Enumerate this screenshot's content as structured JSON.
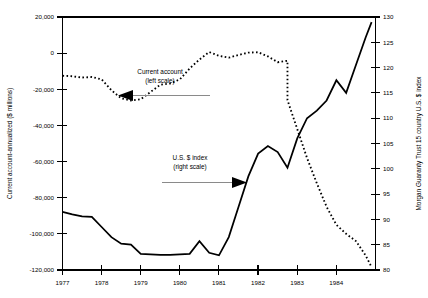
{
  "chart_data": {
    "type": "line",
    "title": "",
    "xlabel": "",
    "ylabel": "Current account-annualized ($ millions)",
    "y2label": "Morgan Guaranty Trust 15 country U.S. $ index",
    "grid": false,
    "legend_position": "inline-annotations",
    "xlim": [
      1977.0,
      1985.0
    ],
    "ylim": [
      -120000,
      20000
    ],
    "y2lim": [
      80,
      130
    ],
    "x_ticks": [
      "1977",
      "1978",
      "1979",
      "1980",
      "1981",
      "1982",
      "1983",
      "1984"
    ],
    "x_tick_values": [
      1977,
      1978,
      1979,
      1980,
      1981,
      1982,
      1983,
      1984
    ],
    "y_ticks": [
      "20,000",
      "0",
      "-20,000",
      "-40,000",
      "-60,000",
      "-80,000",
      "-100,000",
      "-120,000"
    ],
    "y_tick_values": [
      20000,
      0,
      -20000,
      -40000,
      -60000,
      -80000,
      -100000,
      -120000
    ],
    "y2_ticks": [
      "130",
      "125",
      "120",
      "115",
      "110",
      "105",
      "100",
      "95",
      "90",
      "85",
      "80"
    ],
    "y2_tick_values": [
      130,
      125,
      120,
      115,
      110,
      105,
      100,
      95,
      90,
      85,
      80
    ],
    "series": [
      {
        "name": "Current account",
        "axis": "left",
        "style": "dashed",
        "units": "$ millions, annualized",
        "x": [
          1977.0,
          1977.25,
          1977.5,
          1977.75,
          1978.0,
          1978.25,
          1978.5,
          1978.75,
          1979.0,
          1979.25,
          1979.5,
          1979.75,
          1980.0,
          1980.25,
          1980.5,
          1980.75,
          1981.0,
          1981.25,
          1981.5,
          1981.75,
          1982.0,
          1982.25,
          1982.5,
          1982.75,
          1983.0,
          1983.25,
          1983.5,
          1983.75,
          1984.0,
          1984.25,
          1984.5,
          1984.75
        ],
        "values": [
          -12500,
          -12800,
          -13500,
          -13200,
          -14500,
          -20500,
          -25000,
          -26200,
          -25500,
          -21500,
          -17500,
          -16800,
          -14500,
          -8500,
          -3500,
          600,
          -1500,
          -2500,
          -1000,
          300,
          500,
          -1800,
          -5000,
          -4200,
          5800,
          1500,
          -10500,
          -20000,
          -24500,
          -21000,
          -27500,
          -31500
        ]
      },
      {
        "name": "Current account (continued decline)",
        "axis": "left",
        "style": "dashed",
        "units": "$ millions, annualized",
        "x": [
          1982.75,
          1983.0,
          1983.25,
          1983.5,
          1983.75,
          1984.0,
          1984.25,
          1984.5,
          1984.75,
          1984.9
        ],
        "values": [
          -26000,
          -42000,
          -58000,
          -72000,
          -85000,
          -95000,
          -100000,
          -104000,
          -112000,
          -118500
        ]
      },
      {
        "name": "U.S. $ index",
        "axis": "right",
        "style": "solid",
        "units": "index",
        "x": [
          1977.0,
          1977.25,
          1977.5,
          1977.75,
          1978.0,
          1978.25,
          1978.5,
          1978.75,
          1979.0,
          1979.25,
          1979.5,
          1979.75,
          1980.0,
          1980.25,
          1980.5,
          1980.75,
          1981.0,
          1981.25,
          1981.5,
          1981.75,
          1982.0,
          1982.25,
          1982.5,
          1982.75,
          1983.0,
          1983.25,
          1983.5,
          1983.75,
          1984.0,
          1984.25,
          1984.5,
          1984.75,
          1984.9
        ],
        "values": [
          91.5,
          91.0,
          90.6,
          90.5,
          88.5,
          86.5,
          85.2,
          85.0,
          83.2,
          83.1,
          83.0,
          83.0,
          83.1,
          83.2,
          85.7,
          83.4,
          82.9,
          86.5,
          92.5,
          98.5,
          103.0,
          104.5,
          103.3,
          100.2,
          106.0,
          110.0,
          111.5,
          113.5,
          117.5,
          115.0,
          120.5,
          126.0,
          129.0
        ]
      }
    ],
    "annotations": [
      {
        "id": "current-account-annotation",
        "label_line1": "Current account",
        "label_line2": "(left scale)",
        "arrow_direction": "left"
      },
      {
        "id": "dollar-index-annotation",
        "label_line1": "U.S. $ index",
        "label_line2": "(right scale)",
        "arrow_direction": "right"
      }
    ]
  },
  "axes": {
    "left_title": "Current account-annualized ($ millions)",
    "right_title": "Morgan Guaranty Trust 15 country U.S. $ index"
  }
}
